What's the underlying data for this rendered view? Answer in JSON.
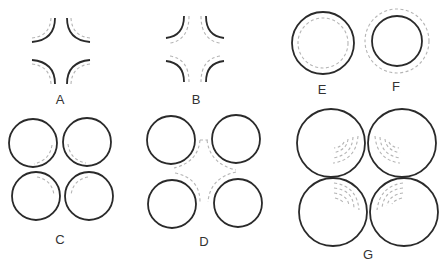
{
  "panels": {
    "A": {
      "label": "A",
      "description": "four concave arcs with dashed offset arcs outside"
    },
    "B": {
      "label": "B",
      "description": "four concave arcs with dashed offset arcs inside"
    },
    "C": {
      "label": "C",
      "description": "four circles with dashed inner arcs toward center"
    },
    "D": {
      "label": "D",
      "description": "four separated circles with dashed arcs between them"
    },
    "E": {
      "label": "E",
      "description": "circle with inner dashed circle"
    },
    "F": {
      "label": "F",
      "description": "circle with outer dashed circle"
    },
    "G": {
      "label": "G",
      "description": "four circles with dashed concentric arc hatching toward center"
    }
  },
  "colors": {
    "solid": "#2a2a2a",
    "dashed": "#b5b5b5",
    "background": "#ffffff"
  }
}
